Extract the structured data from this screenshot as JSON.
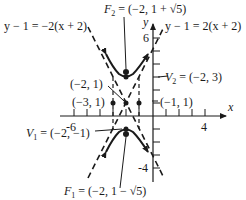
{
  "diagram": {
    "type": "hyperbola-graph",
    "equation_form": "(y-1)^2/4 - (x+2)^2 = 1",
    "axes": {
      "x_label": "x",
      "y_label": "y",
      "x_tick_labels": [
        "-6",
        "4"
      ],
      "y_tick_labels": [
        "6",
        "-4"
      ]
    },
    "labels": {
      "asymptote_left": "y − 1 = −2(x + 2)",
      "asymptote_right": "y − 1 = 2(x + 2)",
      "focus_top_prefix": "F",
      "focus_top_sub": "2",
      "focus_top_value": " = (−2, 1 + √5)",
      "focus_bottom_prefix": "F",
      "focus_bottom_sub": "1",
      "focus_bottom_value": " = (−2, 1 − √5)",
      "vertex_top_prefix": "V",
      "vertex_top_sub": "2",
      "vertex_top_value": " = (−2, 3)",
      "vertex_bottom_prefix": "V",
      "vertex_bottom_sub": "1",
      "vertex_bottom_value": " = (−2, −1)",
      "center": "(−2, 1)",
      "point_left": "(−3, 1)",
      "point_right": "(−1, 1)"
    },
    "points": [
      {
        "name": "V2",
        "x": -2,
        "y": 3
      },
      {
        "name": "V1",
        "x": -2,
        "y": -1
      },
      {
        "name": "F2",
        "x": -2,
        "y": 3.236
      },
      {
        "name": "F1",
        "x": -2,
        "y": -1.236
      },
      {
        "name": "center",
        "x": -2,
        "y": 1
      },
      {
        "name": "left",
        "x": -3,
        "y": 1
      },
      {
        "name": "right",
        "x": -1,
        "y": 1
      }
    ],
    "colors": {
      "ink": "#1a1a1a",
      "background": "#ffffff"
    }
  }
}
